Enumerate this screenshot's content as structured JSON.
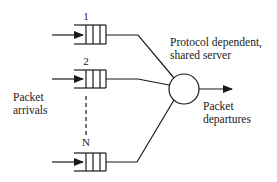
{
  "diagram": {
    "queues": [
      {
        "label": "1"
      },
      {
        "label": "2"
      },
      {
        "label": "N"
      }
    ],
    "server": {
      "label_line1": "Protocol dependent,",
      "label_line2": "shared server"
    },
    "arrivals": {
      "label_line1": "Packet",
      "label_line2": "arrivals"
    },
    "departures": {
      "label_line1": "Packet",
      "label_line2": "departures"
    },
    "colors": {
      "stroke": "#1a1a1a",
      "background": "#ffffff"
    }
  }
}
